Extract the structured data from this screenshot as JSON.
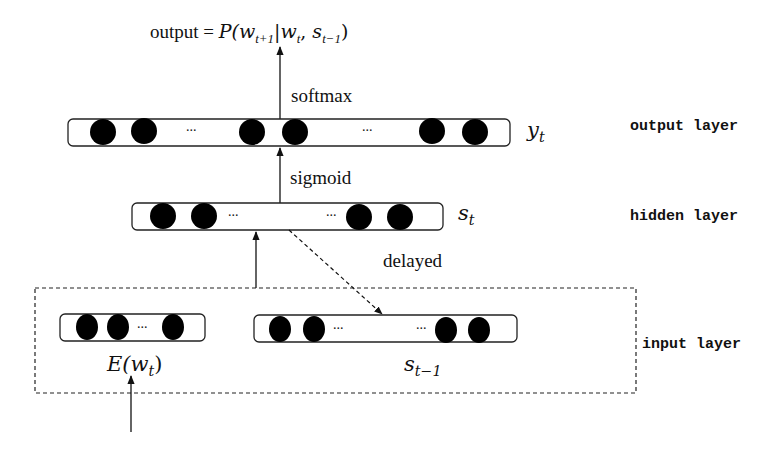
{
  "title": {
    "prefix": "output = ",
    "formula": "P(w_{t+1} | w_t, s_{t-1})",
    "parts": {
      "P": "P(",
      "w1": "w",
      "w1_sub": "t+1",
      "bar": "|",
      "w2": "w",
      "w2_sub": "t",
      "comma": ", ",
      "s": "s",
      "s_sub": "t−1",
      "close": ")"
    }
  },
  "edges": {
    "softmax": "softmax",
    "sigmoid": "sigmoid",
    "delayed": "delayed"
  },
  "layers": {
    "output": {
      "name": "output layer",
      "symbol": "y",
      "symbol_sub": "t",
      "ellipsis": [
        "...",
        "..."
      ]
    },
    "hidden": {
      "name": "hidden layer",
      "symbol": "s",
      "symbol_sub": "t",
      "ellipsis": [
        "...",
        "..."
      ]
    },
    "input": {
      "name": "input layer",
      "embedding": {
        "label_fn": "E(",
        "label_var": "w",
        "label_sub": "t",
        "label_close": ")",
        "ellipsis": "..."
      },
      "previous_state": {
        "symbol": "s",
        "symbol_sub": "t−1",
        "ellipsis": [
          "...",
          "..."
        ]
      }
    }
  },
  "colors": {
    "node": "#000000",
    "line": "#111111",
    "background": "#ffffff"
  }
}
